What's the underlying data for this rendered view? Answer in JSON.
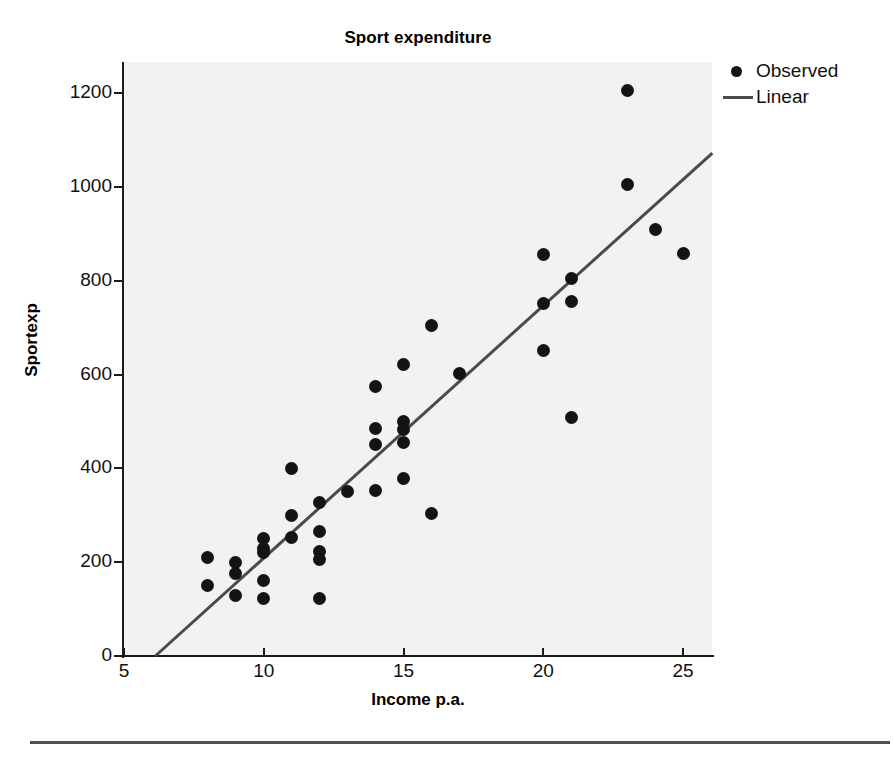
{
  "chart_data": {
    "type": "scatter",
    "title": "Sport expenditure",
    "xlabel": "Income p.a.",
    "ylabel": "Sportexp",
    "xlim": [
      5,
      26.05
    ],
    "ylim": [
      0,
      1265
    ],
    "xticks": [
      5,
      10,
      15,
      20,
      25
    ],
    "yticks": [
      0,
      200,
      400,
      600,
      800,
      1000,
      1200
    ],
    "grid": false,
    "legend_position": "top-right",
    "legend": [
      {
        "label": "Observed",
        "marker": "dot",
        "color": "#141414"
      },
      {
        "label": "Linear",
        "marker": "line",
        "color": "#4a4a4a"
      }
    ],
    "series": [
      {
        "name": "Observed",
        "type": "scatter",
        "marker": "dot",
        "color": "#141414",
        "points": [
          [
            8,
            210
          ],
          [
            8,
            150
          ],
          [
            9,
            200
          ],
          [
            9,
            175
          ],
          [
            9,
            130
          ],
          [
            10,
            250
          ],
          [
            10,
            230
          ],
          [
            10,
            220
          ],
          [
            10,
            160
          ],
          [
            10,
            122
          ],
          [
            11,
            400
          ],
          [
            11,
            300
          ],
          [
            11,
            252
          ],
          [
            12,
            328
          ],
          [
            12,
            265
          ],
          [
            12,
            222
          ],
          [
            12,
            205
          ],
          [
            12,
            122
          ],
          [
            13,
            350
          ],
          [
            14,
            575
          ],
          [
            14,
            485
          ],
          [
            14,
            450
          ],
          [
            14,
            352
          ],
          [
            15,
            622
          ],
          [
            15,
            500
          ],
          [
            15,
            482
          ],
          [
            15,
            455
          ],
          [
            15,
            378
          ],
          [
            16,
            705
          ],
          [
            16,
            303
          ],
          [
            17,
            602
          ],
          [
            20,
            855
          ],
          [
            20,
            752
          ],
          [
            20,
            652
          ],
          [
            21,
            805
          ],
          [
            21,
            755
          ],
          [
            21,
            508
          ],
          [
            23,
            1205
          ],
          [
            23,
            1005
          ],
          [
            24,
            908
          ],
          [
            25,
            858
          ]
        ]
      },
      {
        "name": "Linear",
        "type": "line",
        "color": "#4a4a4a",
        "points": [
          [
            6.12,
            0
          ],
          [
            26.05,
            1072
          ]
        ]
      }
    ]
  }
}
